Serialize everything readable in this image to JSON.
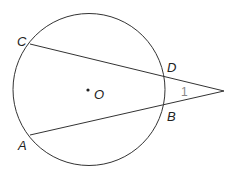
{
  "diagram": {
    "circle": {
      "center_label": "O"
    },
    "points": {
      "C": "C",
      "D": "D",
      "B": "B",
      "A": "A"
    },
    "angle_label": "1",
    "colors": {
      "stroke": "#333333",
      "angle_label": "#888888"
    }
  }
}
